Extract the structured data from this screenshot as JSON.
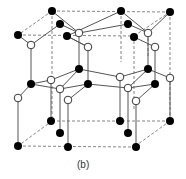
{
  "figure": {
    "caption": "(b)",
    "colors": {
      "atom_a": "#000000",
      "atom_b": "#ffffff",
      "bond": "#555555",
      "cell_edge": "#777777"
    },
    "legend": []
  }
}
